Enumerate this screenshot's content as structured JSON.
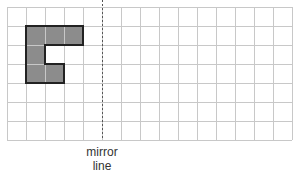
{
  "grid": {
    "columns": 15,
    "rows": 7,
    "origin_x": 7,
    "origin_y": 7,
    "cell_size": 19,
    "line_color": "#c8c8c8"
  },
  "shape": {
    "fill_color": "#8c8c8c",
    "stroke_color": "#222222",
    "cells": [
      [
        1,
        1
      ],
      [
        2,
        1
      ],
      [
        3,
        1
      ],
      [
        1,
        2
      ],
      [
        1,
        3
      ],
      [
        2,
        3
      ]
    ]
  },
  "mirror": {
    "column_index": 5,
    "line_color": "#555555",
    "label_line1": "mirror",
    "label_line2": "line"
  }
}
